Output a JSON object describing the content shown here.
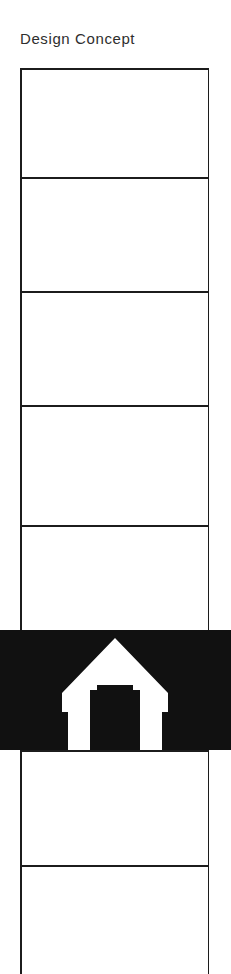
{
  "page": {
    "title": "Design Concept",
    "background_color": "#ffffff",
    "ink_color": "#1c1c1c",
    "highlight_color": "#111111",
    "highlight_foreground": "#ffffff",
    "width": 231,
    "height": 974
  },
  "panel_column": {
    "name": "storyboard-panel-column",
    "left": 20,
    "top": 68,
    "width": 189,
    "height": 906,
    "border_color": "#1c1c1c",
    "border_width": 1.5,
    "divider_offsets": [
      109,
      223,
      337,
      457,
      562,
      682,
      797
    ],
    "panels": [
      {
        "index": 1,
        "label": "",
        "top": 0,
        "height": 109,
        "state": "empty"
      },
      {
        "index": 2,
        "label": "",
        "top": 109,
        "height": 114,
        "state": "empty"
      },
      {
        "index": 3,
        "label": "",
        "top": 223,
        "height": 114,
        "state": "empty"
      },
      {
        "index": 4,
        "label": "",
        "top": 337,
        "height": 120,
        "state": "empty"
      },
      {
        "index": 5,
        "label": "",
        "top": 457,
        "height": 105,
        "state": "empty"
      },
      {
        "index": 6,
        "label": "",
        "top": 562,
        "height": 120,
        "state": "highlighted"
      },
      {
        "index": 7,
        "label": "",
        "top": 682,
        "height": 115,
        "state": "empty"
      },
      {
        "index": 8,
        "label": "",
        "top": 797,
        "height": 109,
        "state": "empty-open"
      }
    ]
  },
  "highlight_band": {
    "name": "highlighted-panel-band",
    "left": 0,
    "top": 630,
    "width": 231,
    "height": 120,
    "fill": "#111111"
  },
  "house_icon": {
    "name": "house-icon",
    "semantic": "house-icon",
    "left": 62,
    "top": 638,
    "width": 106,
    "height": 112,
    "stroke": "#ffffff",
    "description": "white outlined house with peaked roof and square opening"
  }
}
